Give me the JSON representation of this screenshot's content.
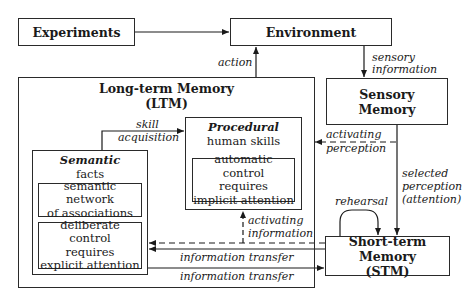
{
  "nodes": {
    "experiments": {
      "label": "Experiments"
    },
    "environment": {
      "label": "Environment"
    },
    "ltm": {
      "title_line1": "Long-term Memory",
      "title_line2": "(LTM)"
    },
    "sensory": {
      "line1": "Sensory",
      "line2": "Memory"
    },
    "procedural": {
      "title": "Procedural",
      "subtitle": "human skills",
      "inner_line1": "automatic control",
      "inner_line2": "requires",
      "inner_line3": "implicit attention"
    },
    "semantic": {
      "title": "Semantic",
      "subtitle": "facts",
      "inner1_line1": "semantic network",
      "inner1_line2": "of associations",
      "inner2_line1": "deliberate control",
      "inner2_line2": "requires",
      "inner2_line3": "explicit attention"
    },
    "stm": {
      "line1": "Short-term Memory",
      "line2": "(STM)"
    }
  },
  "edges": {
    "action": "action",
    "sensory_info_1": "sensory",
    "sensory_info_2": "information",
    "skill_1": "skill",
    "skill_2": "acquisition",
    "act_perc_1": "activating",
    "act_perc_2": "perception",
    "selected_1": "selected",
    "selected_2": "perception",
    "selected_3": "(attention)",
    "rehearsal": "rehearsal",
    "act_info_1": "activating",
    "act_info_2": "information",
    "transfer_1": "information transfer",
    "transfer_2": "information transfer"
  }
}
